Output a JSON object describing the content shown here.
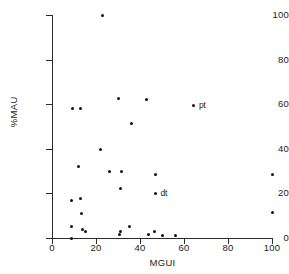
{
  "chart_data": {
    "type": "scatter",
    "title": "",
    "xlabel": "MGUI",
    "ylabel": "%MAU",
    "xlim": [
      0,
      100
    ],
    "ylim": [
      0,
      100
    ],
    "xticks": [
      0,
      20,
      40,
      60,
      80,
      100
    ],
    "yticks": [
      0,
      20,
      40,
      60,
      80,
      100
    ],
    "grid": false,
    "legend": "none",
    "marker": "filled-circle",
    "marker_color": "#111111",
    "axis_color": "#2b2b2b",
    "background": "#ffffff",
    "points": [
      {
        "x": 9,
        "y": 0
      },
      {
        "x": 9,
        "y": 5
      },
      {
        "x": 9,
        "y": 17
      },
      {
        "x": 9.5,
        "y": 58
      },
      {
        "x": 12,
        "y": 32
      },
      {
        "x": 13,
        "y": 17.5
      },
      {
        "x": 13,
        "y": 58
      },
      {
        "x": 13.5,
        "y": 11
      },
      {
        "x": 14,
        "y": 4
      },
      {
        "x": 15,
        "y": 3
      },
      {
        "x": 22,
        "y": 39.5
      },
      {
        "x": 23,
        "y": 100
      },
      {
        "x": 26,
        "y": 30
      },
      {
        "x": 30,
        "y": 62.5
      },
      {
        "x": 30.5,
        "y": 1.5
      },
      {
        "x": 31,
        "y": 3
      },
      {
        "x": 31,
        "y": 22
      },
      {
        "x": 31.5,
        "y": 30
      },
      {
        "x": 35,
        "y": 5
      },
      {
        "x": 36,
        "y": 51.5
      },
      {
        "x": 43,
        "y": 62
      },
      {
        "x": 44,
        "y": 1.5
      },
      {
        "x": 46.5,
        "y": 3
      },
      {
        "x": 47,
        "y": 28.5
      },
      {
        "x": 47,
        "y": 20,
        "label": "dt"
      },
      {
        "x": 50,
        "y": 1
      },
      {
        "x": 56,
        "y": 1
      },
      {
        "x": 64.5,
        "y": 59.5,
        "label": "pt"
      },
      {
        "x": 100,
        "y": 28.5
      },
      {
        "x": 100,
        "y": 11.5
      }
    ],
    "annotations": [
      {
        "text": "dt",
        "x": 47,
        "y": 20
      },
      {
        "text": "pt",
        "x": 64.5,
        "y": 59.5
      }
    ]
  }
}
